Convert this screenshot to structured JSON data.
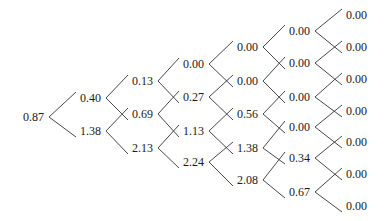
{
  "diagram": {
    "type": "binomial-tree",
    "columns": [
      {
        "x": 23,
        "nodes": [
          {
            "label": "0.87",
            "y": 117
          }
        ]
      },
      {
        "x": 80,
        "nodes": [
          {
            "label": "0.40",
            "y": 98
          },
          {
            "label": "1.38",
            "y": 131
          }
        ]
      },
      {
        "x": 132,
        "nodes": [
          {
            "label": "0.13",
            "y": 81
          },
          {
            "label": "0.69",
            "y": 114
          },
          {
            "label": "2.13",
            "y": 148
          }
        ]
      },
      {
        "x": 183,
        "nodes": [
          {
            "label": "0.00",
            "y": 64
          },
          {
            "label": "0.27",
            "y": 97
          },
          {
            "label": "1.13",
            "y": 131
          },
          {
            "label": "2.24",
            "y": 162
          }
        ]
      },
      {
        "x": 237,
        "nodes": [
          {
            "label": "0.00",
            "y": 47
          },
          {
            "label": "0.00",
            "y": 81
          },
          {
            "label": "0.56",
            "y": 114
          },
          {
            "label": "1.38",
            "y": 148
          },
          {
            "label": "2.08",
            "y": 180
          }
        ]
      },
      {
        "x": 289,
        "nodes": [
          {
            "label": "0.00",
            "y": 31
          },
          {
            "label": "0.00",
            "y": 63
          },
          {
            "label": "0.00",
            "y": 97
          },
          {
            "label": "0.00",
            "y": 127
          },
          {
            "label": "0.34",
            "y": 158
          },
          {
            "label": "0.67",
            "y": 192
          }
        ]
      },
      {
        "x": 346,
        "nodes": [
          {
            "label": "0.00",
            "y": 15
          },
          {
            "label": "0.00",
            "y": 47
          },
          {
            "label": "0.00",
            "y": 79
          },
          {
            "label": "0.00",
            "y": 111
          },
          {
            "label": "0.00",
            "y": 142
          },
          {
            "label": "0.00",
            "y": 174
          },
          {
            "label": "0.00",
            "y": 206
          }
        ]
      }
    ],
    "node_width": 22,
    "line_color": "#333333",
    "text_color": "#1a1a1a"
  }
}
